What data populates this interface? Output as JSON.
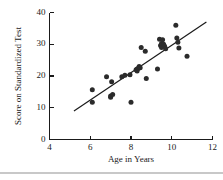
{
  "chart_data": {
    "type": "scatter",
    "title": "",
    "xlabel": "Age in Years",
    "ylabel": "Score on Standardized Test",
    "xlim": [
      4,
      12
    ],
    "ylim": [
      0,
      40
    ],
    "xticks": [
      4,
      6,
      8,
      10,
      12
    ],
    "yticks": [
      0,
      10,
      20,
      30,
      40
    ],
    "grid": false,
    "legend": "none",
    "marker_color": "#2b2b2b",
    "line_color": "#1a1a1a",
    "x": [
      6.1,
      6.1,
      6.8,
      7.0,
      7.0,
      7.05,
      7.1,
      7.55,
      7.7,
      7.95,
      8.0,
      8.25,
      8.3,
      8.3,
      8.35,
      8.4,
      8.45,
      8.5,
      8.7,
      8.75,
      9.3,
      9.4,
      9.45,
      9.5,
      9.5,
      9.55,
      9.6,
      9.65,
      9.7,
      10.2,
      10.25,
      10.3,
      10.35,
      10.75
    ],
    "y": [
      15.7,
      11.7,
      19.8,
      13.3,
      13.7,
      18.2,
      14.2,
      19.8,
      20.2,
      20.4,
      11.7,
      22.0,
      22.2,
      21.6,
      22.4,
      23.0,
      22.6,
      29.0,
      27.8,
      19.2,
      22.2,
      31.6,
      29.6,
      30.2,
      29.0,
      31.4,
      30.0,
      29.4,
      28.6,
      36.0,
      32.0,
      30.6,
      28.8,
      26.2
    ],
    "fit_line": {
      "x0": 5.2,
      "y0": 9.0,
      "x1": 11.7,
      "y1": 37.0
    },
    "series_name": "observations"
  },
  "figure": {
    "footer_rule_color": "#c8c8c8"
  }
}
